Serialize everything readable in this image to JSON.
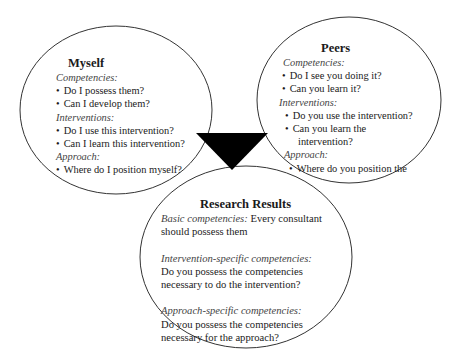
{
  "diagram": {
    "type": "three-ellipse concept diagram with central arrow",
    "colors": {
      "outline": "#333333",
      "arrow": "#000000",
      "text": "#1a1a1a",
      "category_text": "#444444"
    },
    "myself": {
      "title": "Myself",
      "sections": [
        {
          "label": "Competencies:",
          "items": [
            "Do I possess them?",
            "Can I develop them?"
          ]
        },
        {
          "label": "Interventions:",
          "items": [
            "Do I use this intervention?",
            "Can I learn this intervention?"
          ]
        },
        {
          "label": "Approach:",
          "items": [
            "Where do I position myself?"
          ]
        }
      ]
    },
    "peers": {
      "title": "Peers",
      "sections": [
        {
          "label": "Competencies:",
          "items": [
            "Do I see you doing it?",
            "Can you learn it?"
          ]
        },
        {
          "label": "Interventions:",
          "items": [
            "Do you use the intervention?",
            "Can you learn the",
            "intervention?"
          ]
        },
        {
          "label": "Approach:",
          "items": [
            "Where do you position the"
          ]
        }
      ]
    },
    "research_results": {
      "title": "Research Results",
      "basic_label": "Basic competencies:",
      "basic_text_1": " Every consultant",
      "basic_text_2": "should possess them",
      "intervention_label": "Intervention-specific competencies:",
      "intervention_text_1": "Do you possess the competencies",
      "intervention_text_2": "necessary to do the intervention?",
      "approach_label": "Approach-specific competencies:",
      "approach_text_1": "Do you possess the competencies",
      "approach_text_2": "necessary for the approach?"
    }
  }
}
